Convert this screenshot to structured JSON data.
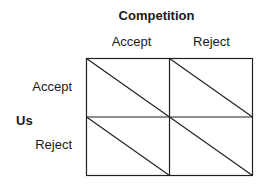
{
  "diagram": {
    "column_player": "Competition",
    "row_player": "Us",
    "columns": [
      "Accept",
      "Reject"
    ],
    "rows": [
      "Accept",
      "Reject"
    ],
    "cells": [
      [
        {
          "diagonal": "top-left to bottom-right"
        },
        {
          "diagonal": "top-left to bottom-right"
        }
      ],
      [
        {
          "diagonal": "top-left to bottom-right"
        },
        {
          "diagonal": "top-left to bottom-right"
        }
      ]
    ]
  }
}
